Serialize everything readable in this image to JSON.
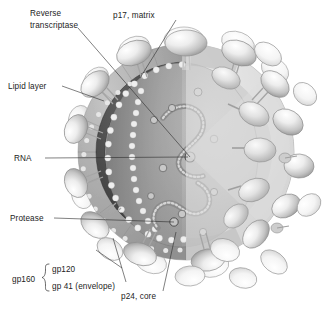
{
  "figure": {
    "background_color": "#ffffff"
  },
  "labels": {
    "reverse_transcriptase_line1": "Reverse",
    "reverse_transcriptase_line2": "transcriptase",
    "p17_matrix": "p17, matrix",
    "lipid_layer": "Lipid layer",
    "rna": "RNA",
    "protease": "Protease",
    "gp160": "gp160",
    "gp120": "gp120",
    "gp41_envelope": "gp 41 (envelope)",
    "p24_core": "p24, core"
  },
  "colors": {
    "background": "#ffffff",
    "text": "#1c1c1c",
    "leader_line": "#2b2b2b",
    "spike_light": "#f2f2f2",
    "spike_mid": "#c9c9c9",
    "spike_dark": "#9a9a9a",
    "envelope_outer": "#d9d9d9",
    "lipid_band": "#a8a8a8",
    "matrix_dark": "#4a4a4a",
    "core_fill": "#b4b4b4",
    "core_shadow": "#8d8d8d",
    "bead_light": "#ececec",
    "rna_strand": "#7a7a7a"
  },
  "structures": [
    {
      "name": "envelope-spike-gp120",
      "count": 34,
      "description": "ovoid knobs on the virion surface"
    },
    {
      "name": "gp41-stalk",
      "count": 18,
      "description": "short stalks anchoring knobs to envelope"
    },
    {
      "name": "lipid-bilayer",
      "description": "grey annulus forming the viral membrane"
    },
    {
      "name": "p17-matrix-ring",
      "description": "dark beaded ring just inside the lipid layer"
    },
    {
      "name": "p24-core-capsid",
      "description": "inner cone-shaped capsid outlined by pale beads"
    },
    {
      "name": "rna-strand",
      "count": 2,
      "description": "zigzag beaded genomic RNA strands"
    },
    {
      "name": "reverse-transcriptase-particle",
      "description": "small circle bound to the RNA strand"
    },
    {
      "name": "protease-particle",
      "description": "small circle in the lower core"
    }
  ]
}
